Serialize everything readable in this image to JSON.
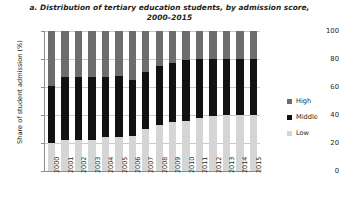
{
  "chart_data": {
    "type": "bar",
    "subtype": "stacked-bar-100",
    "title": "a. Distribution of tertiary education students, by admission score, 2000–2015",
    "title_line1": "a. Distribution of tertiary education students, by admission score,",
    "title_line2": "2000–2015",
    "xlabel": "",
    "ylabel": "Share of student admission (%)",
    "ylim": [
      0,
      100
    ],
    "yticks": [
      0,
      20,
      40,
      60,
      80,
      100
    ],
    "ytick_labels": [
      "0",
      "20",
      "40",
      "60",
      "80",
      "100"
    ],
    "grid": true,
    "grid_axis": "y",
    "legend_position": "right",
    "categories": [
      "2000",
      "2001",
      "2002",
      "2003",
      "2004",
      "2005",
      "2006",
      "2007",
      "2008",
      "2009",
      "2010",
      "2011",
      "2012",
      "2013",
      "2014",
      "2015"
    ],
    "series": [
      {
        "name": "Low",
        "color": "#d5d5d5",
        "values": [
          20,
          22,
          22,
          22,
          24,
          24,
          25,
          30,
          33,
          35,
          36,
          38,
          39,
          40,
          40,
          40
        ]
      },
      {
        "name": "Middle",
        "color": "#121212",
        "values": [
          41,
          45,
          45,
          45,
          43,
          44,
          40,
          41,
          42,
          42,
          43,
          42,
          41,
          40,
          40,
          40
        ]
      },
      {
        "name": "High",
        "color": "#6d6d6d",
        "values": [
          39,
          33,
          33,
          33,
          33,
          32,
          35,
          29,
          25,
          23,
          21,
          20,
          20,
          20,
          20,
          20
        ]
      }
    ],
    "stack_tops": {
      "low_top": [
        20,
        22,
        22,
        22,
        24,
        24,
        25,
        30,
        33,
        35,
        36,
        38,
        39,
        40,
        40,
        40
      ],
      "middle_top": [
        61,
        67,
        67,
        67,
        67,
        68,
        65,
        71,
        75,
        77,
        79,
        80,
        80,
        80,
        80,
        80
      ]
    }
  },
  "legend": {
    "items": [
      {
        "label": "High",
        "color": "#6d6d6d"
      },
      {
        "label": "Middle",
        "color": "#121212"
      },
      {
        "label": "Low",
        "color": "#d5d5d5"
      }
    ]
  }
}
